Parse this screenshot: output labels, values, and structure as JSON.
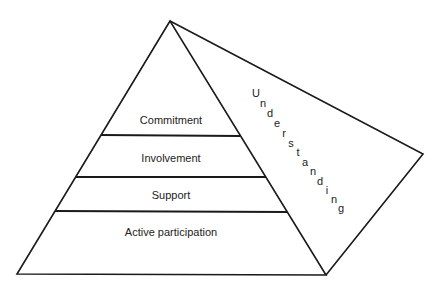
{
  "diagram": {
    "type": "pyramid",
    "colors": {
      "stroke": "#1a1a1a",
      "text": "#222222",
      "background": "#ffffff"
    },
    "layers": [
      {
        "label": "Commitment"
      },
      {
        "label": "Involvement"
      },
      {
        "label": "Support"
      },
      {
        "label": "Active participation"
      }
    ],
    "side_face": {
      "label": "Understanding",
      "letters": [
        "U",
        "n",
        "d",
        "e",
        "r",
        "s",
        "t",
        "a",
        "n",
        "d",
        "i",
        "n",
        "g"
      ]
    }
  }
}
